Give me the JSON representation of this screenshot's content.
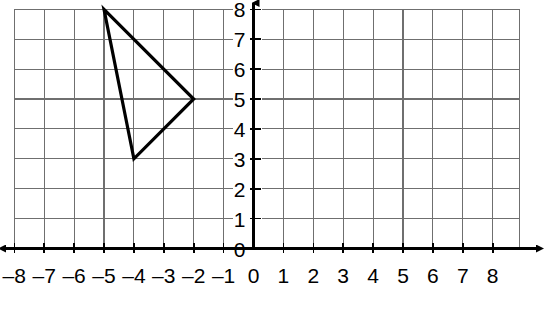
{
  "chart_data": {
    "type": "scatter",
    "title": "",
    "xlabel": "",
    "ylabel": "",
    "xlim": [
      -8,
      8
    ],
    "ylim": [
      0,
      8
    ],
    "grid": true,
    "legend": null,
    "x_tick_labels": [
      "–8",
      "–7",
      "–6",
      "–5",
      "–4",
      "–3",
      "–2",
      "–1",
      "0",
      "1",
      "2",
      "3",
      "4",
      "5",
      "6",
      "7",
      "8"
    ],
    "x_tick_values": [
      -8,
      -7,
      -6,
      -5,
      -4,
      -3,
      -2,
      -1,
      0,
      1,
      2,
      3,
      4,
      5,
      6,
      7,
      8
    ],
    "y_tick_labels": [
      "0",
      "1",
      "2",
      "3",
      "4",
      "5",
      "6",
      "7",
      "8"
    ],
    "y_tick_values": [
      0,
      1,
      2,
      3,
      4,
      5,
      6,
      7,
      8
    ],
    "shapes": [
      {
        "name": "triangle",
        "closed": true,
        "stroke": "#000000",
        "fill": "none",
        "points": [
          {
            "x": -5,
            "y": 8
          },
          {
            "x": -2,
            "y": 5
          },
          {
            "x": -4,
            "y": 3
          }
        ]
      }
    ],
    "axes": {
      "x_axis_arrows": "both",
      "y_axis_arrows": "up",
      "origin_label": "0"
    },
    "colors": {
      "gridline": "#6f6f6f",
      "axis": "#000000",
      "shape_stroke": "#000000",
      "background": "#ffffff"
    }
  }
}
